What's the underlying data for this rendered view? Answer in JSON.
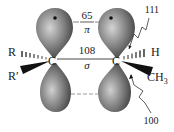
{
  "diagram": {
    "type": "pi-bond-orbital-diagram",
    "colors": {
      "lobe_light": "#c9c9c9",
      "lobe_mid": "#8a8a8a",
      "lobe_dark": "#3c3c3c",
      "ink": "#1a1a1a",
      "line": "#555555"
    },
    "carbons": [
      {
        "label": "C",
        "position": "left"
      },
      {
        "label": "C",
        "position": "right"
      }
    ],
    "substituents": {
      "left_hashed": "R",
      "left_wedge": "R′",
      "right_hashed": "H",
      "right_wedge": "CH",
      "right_wedge_subscript": "3"
    },
    "bond_labels": {
      "pi_value": "65",
      "pi_symbol": "π",
      "sigma_value": "108",
      "sigma_symbol": "σ"
    },
    "annotations": {
      "top_right": "111",
      "bottom_right": "100"
    }
  }
}
